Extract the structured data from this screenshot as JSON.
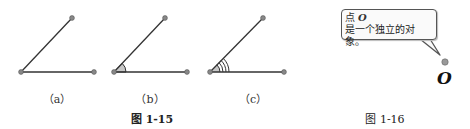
{
  "figure_1_15": {
    "caption": "图 1-15",
    "panels": [
      {
        "label": "（a）",
        "angle_marks": 0
      },
      {
        "label": "（b）",
        "angle_marks": 1
      },
      {
        "label": "（c）",
        "angle_marks": 4
      }
    ]
  },
  "figure_1_16": {
    "caption": "图 1-16",
    "callout": {
      "title_prefix": "点",
      "title_var": "O",
      "text": "是一个独立的对象。"
    },
    "point_label": "O"
  },
  "colors": {
    "line": "#333333",
    "endpoint": "#888888",
    "angle_fill": "#c8c8c8"
  }
}
